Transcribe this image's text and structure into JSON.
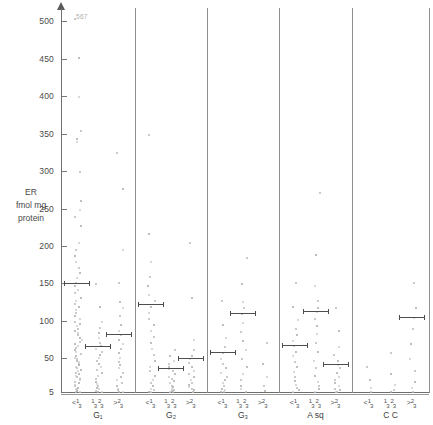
{
  "figure": {
    "axis_title_lines": [
      "ER",
      "fmol mg",
      "protein"
    ],
    "outlier_annotation": "567"
  },
  "chart_data": {
    "type": "scatter",
    "title": "",
    "xlabel": "",
    "ylabel": "ER fmol mg protein",
    "ylim": [
      5,
      510
    ],
    "grid": false,
    "legend": "none",
    "yticks": [
      5,
      50,
      100,
      150,
      200,
      250,
      300,
      350,
      400,
      450,
      500
    ],
    "ytick_labels": [
      "5",
      "50",
      "100",
      "150",
      "200",
      "250",
      "300",
      "350",
      "400",
      "450",
      "500"
    ],
    "annotations": [
      {
        "text": "567",
        "x_group": "G1",
        "x_category": "<1/3",
        "y": 505,
        "note": "off-scale value"
      }
    ],
    "group_labels": [
      "G₁",
      "G₂",
      "G₃",
      "A sq",
      "C C"
    ],
    "category_labels": [
      "<1/3",
      "1/3-2/3",
      ">2/3"
    ],
    "series": [
      {
        "name": "G1 <1/3",
        "group": "G₁",
        "category": "<1/3",
        "median": 150,
        "values": [
          505,
          452,
          400,
          355,
          345,
          340,
          300,
          262,
          250,
          240,
          228,
          205,
          196,
          188,
          180,
          172,
          165,
          158,
          152,
          148,
          142,
          138,
          132,
          128,
          124,
          120,
          116,
          112,
          108,
          104,
          100,
          97,
          94,
          91,
          88,
          85,
          82,
          79,
          76,
          73,
          70,
          68,
          65,
          62,
          60,
          57,
          55,
          52,
          50,
          48,
          46,
          44,
          42,
          40,
          38,
          36,
          34,
          32,
          30,
          28,
          26,
          24,
          22,
          20,
          18,
          16,
          14,
          12,
          10,
          9,
          8,
          7,
          6
        ]
      },
      {
        "name": "G1 1/3-2/3",
        "group": "G₁",
        "category": "1/3-2/3",
        "median": 67,
        "values": [
          150,
          120,
          100,
          92,
          85,
          78,
          72,
          68,
          64,
          60,
          56,
          52,
          48,
          44,
          40,
          36,
          32,
          28,
          24,
          20,
          17,
          14,
          12,
          10,
          8,
          7,
          6
        ]
      },
      {
        "name": "G1 >2/3",
        "group": "G₁",
        "category": ">2/3",
        "median": 82,
        "values": [
          325,
          278,
          196,
          152,
          126,
          118,
          108,
          96,
          88,
          82,
          76,
          70,
          64,
          58,
          52,
          46,
          42,
          38,
          32,
          27,
          22,
          18,
          14,
          11,
          9,
          7,
          6
        ]
      },
      {
        "name": "G2 <1/3",
        "group": "G₂",
        "category": "<1/3",
        "median": 122,
        "values": [
          350,
          218,
          180,
          160,
          148,
          136,
          128,
          120,
          112,
          104,
          96,
          88,
          80,
          72,
          64,
          56,
          48,
          40,
          34,
          28,
          22,
          18,
          14,
          11,
          9,
          7,
          6
        ]
      },
      {
        "name": "G2 1/3-2/3",
        "group": "G₂",
        "category": "1/3-2/3",
        "median": 37,
        "values": [
          62,
          54,
          48,
          44,
          40,
          37,
          34,
          30,
          27,
          24,
          21,
          18,
          15,
          13,
          11,
          9,
          8,
          7,
          6
        ]
      },
      {
        "name": "G2 >2/3",
        "group": "G₂",
        "category": ">2/3",
        "median": 50,
        "values": [
          205,
          132,
          76,
          62,
          55,
          50,
          45,
          40,
          35,
          30,
          26,
          22,
          19,
          16,
          13,
          11,
          9,
          7,
          6
        ]
      },
      {
        "name": "G3 <1/3",
        "group": "G₃",
        "category": "<1/3",
        "median": 58,
        "values": [
          128,
          96,
          78,
          66,
          58,
          50,
          44,
          38,
          32,
          27,
          22,
          18,
          14,
          11,
          9,
          7,
          6
        ]
      },
      {
        "name": "G3 1/3-2/3",
        "group": "G₃",
        "category": "1/3-2/3",
        "median": 110,
        "values": [
          185,
          150,
          126,
          118,
          110,
          98,
          86,
          74,
          62,
          50,
          40,
          30,
          22,
          15,
          10,
          7
        ]
      },
      {
        "name": "G3 >2/3",
        "group": "G₃",
        "category": ">2/3",
        "median": null,
        "values": [
          72,
          44,
          26,
          14,
          8
        ]
      },
      {
        "name": "Asq <1/3",
        "group": "A sq",
        "category": "<1/3",
        "median": 68,
        "values": [
          152,
          120,
          102,
          90,
          82,
          74,
          68,
          60,
          54,
          46,
          40,
          33,
          27,
          21,
          16,
          12,
          9,
          7
        ]
      },
      {
        "name": "Asq 1/3-2/3",
        "group": "A sq",
        "category": "1/3-2/3",
        "median": 113,
        "values": [
          272,
          190,
          148,
          128,
          118,
          113,
          104,
          94,
          84,
          72,
          60,
          48,
          38,
          28,
          20,
          14,
          10,
          7
        ]
      },
      {
        "name": "Asq >2/3",
        "group": "A sq",
        "category": ">2/3",
        "median": 43,
        "values": [
          118,
          88,
          66,
          56,
          48,
          43,
          38,
          32,
          27,
          22,
          18,
          14,
          11,
          9,
          7,
          6
        ]
      },
      {
        "name": "CC <1/3",
        "group": "C C",
        "category": "<1/3",
        "median": null,
        "values": [
          40,
          22,
          12,
          7
        ]
      },
      {
        "name": "CC 1/3-2/3",
        "group": "C C",
        "category": "1/3-2/3",
        "median": null,
        "values": [
          58,
          30,
          16,
          9,
          6
        ]
      },
      {
        "name": "CC >2/3",
        "group": "C C",
        "category": ">2/3",
        "median": 105,
        "values": [
          152,
          118,
          105,
          90,
          70,
          50,
          34,
          20,
          12,
          7
        ]
      }
    ]
  }
}
